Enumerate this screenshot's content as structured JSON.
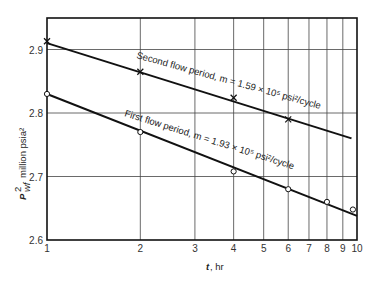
{
  "chart_data": {
    "type": "line",
    "title": "",
    "xlabel": "t, hr",
    "ylabel": "P²wf, million psia²",
    "xscale": "log",
    "xlim": [
      1,
      10
    ],
    "ylim": [
      2.6,
      2.95
    ],
    "xticks": [
      1,
      2,
      3,
      4,
      5,
      6,
      7,
      8,
      9,
      10
    ],
    "yticks": [
      2.6,
      2.7,
      2.8,
      2.9
    ],
    "grid": true,
    "series": [
      {
        "name": "Second flow period",
        "marker": "x",
        "annotation": "Second flow period, m = 1.59 × 10⁵ psi²/cycle",
        "points": [
          {
            "t": 1,
            "p": 2.913
          },
          {
            "t": 2,
            "p": 2.865
          },
          {
            "t": 4,
            "p": 2.824
          },
          {
            "t": 6,
            "p": 2.79
          }
        ],
        "fit_line": [
          {
            "t": 1,
            "p": 2.91
          },
          {
            "t": 9.6,
            "p": 2.76
          }
        ]
      },
      {
        "name": "First flow period",
        "marker": "o",
        "annotation": "First flow period, m = 1.93 × 10⁵ psi²/cycle",
        "points": [
          {
            "t": 1,
            "p": 2.83
          },
          {
            "t": 2,
            "p": 2.77
          },
          {
            "t": 4,
            "p": 2.708
          },
          {
            "t": 6,
            "p": 2.68
          },
          {
            "t": 8,
            "p": 2.66
          },
          {
            "t": 9.7,
            "p": 2.648
          }
        ],
        "fit_line": [
          {
            "t": 1,
            "p": 2.83
          },
          {
            "t": 10,
            "p": 2.638
          }
        ]
      }
    ]
  },
  "labels": {
    "ylabel_main": "P",
    "ylabel_sup": "2",
    "ylabel_sub": "wf",
    "ylabel_rest": "million psia²",
    "xlabel_t": "t",
    "xlabel_rest": ", hr",
    "upper_annotation": "Second flow period, m = 1.59 × 10⁵ psi²/cycle",
    "lower_annotation": "First flow period, m = 1.93 × 10⁵ psi²/cycle"
  }
}
